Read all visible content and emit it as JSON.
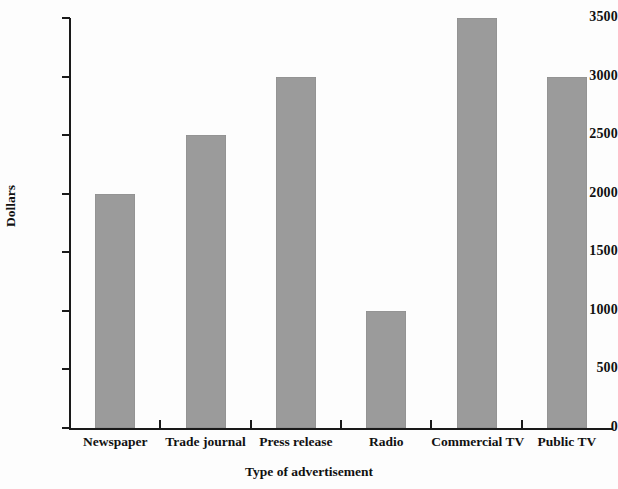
{
  "chart_data": {
    "type": "bar",
    "title": "",
    "subtitle": "",
    "xlabel": "Type of advertisement",
    "ylabel": "Dollars",
    "categories": [
      "Newspaper",
      "Trade journal",
      "Press release",
      "Radio",
      "Commercial TV",
      "Public TV"
    ],
    "values": [
      2000,
      2500,
      3000,
      1000,
      3500,
      3000
    ],
    "ylim": [
      0,
      3500
    ],
    "yticks": [
      0,
      500,
      1000,
      1500,
      2000,
      2500,
      3000,
      3500
    ],
    "ytick_labels": [
      "0",
      "500",
      "1000",
      "1500",
      "2000",
      "2500",
      "3000",
      "3500"
    ],
    "grid": false,
    "legend": false,
    "legend_position": "none",
    "bar_color": "#9b9b9b",
    "axis_color": "#1a1a1a",
    "background_color": "#fdfdfd",
    "text_color": "#111111"
  }
}
